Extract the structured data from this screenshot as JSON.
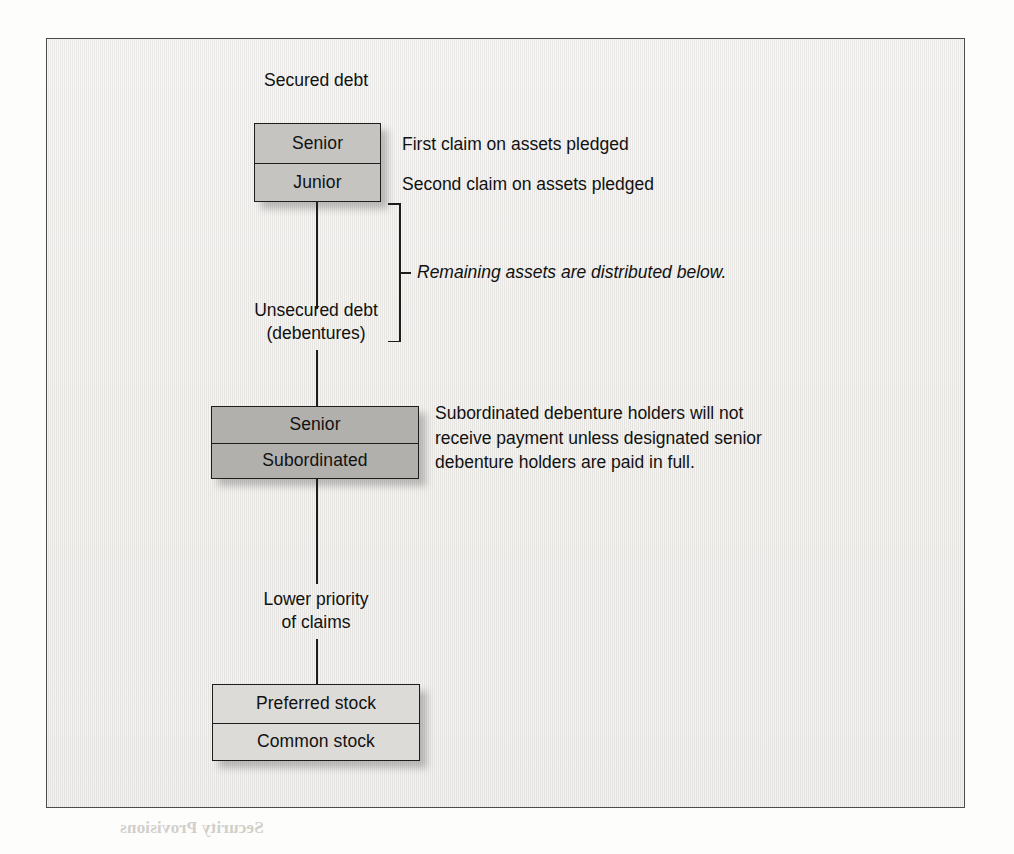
{
  "figure": {
    "secured_debt_label": "Secured debt",
    "unsecured_debt_label": "Unsecured debt\n(debentures)",
    "lower_priority_label": "Lower priority\nof claims",
    "remaining_assets_note": "Remaining assets are distributed below.",
    "secured_box": {
      "rows": [
        {
          "label": "Senior"
        },
        {
          "label": "Junior"
        }
      ],
      "fill": "#c5c4c1"
    },
    "secured_annotations": [
      "First claim on assets pledged",
      "Second claim on assets pledged"
    ],
    "unsecured_box": {
      "rows": [
        {
          "label": "Senior"
        },
        {
          "label": "Subordinated"
        }
      ],
      "fill": "#b1b0ad"
    },
    "unsecured_note": "Subordinated debenture holders will not\nreceive payment unless designated senior\ndebenture holders are paid in full.",
    "equity_box": {
      "rows": [
        {
          "label": "Preferred stock"
        },
        {
          "label": "Common stock"
        }
      ],
      "fill": "#dcdbd8"
    },
    "panel_fill": "#edebe9",
    "line_color": "#1d1d1d"
  },
  "background_bleed": {
    "lines": [
      "Security Provisions",
      "the security provisions",
      "indenture are",
      "pledged assets",
      "A number of terms are used to describe",
      "the general priority and equipment",
      "tion. A mortgage may be senior or junior",
      "claims before general creditors. Under",
      "the acquired property"
    ]
  }
}
